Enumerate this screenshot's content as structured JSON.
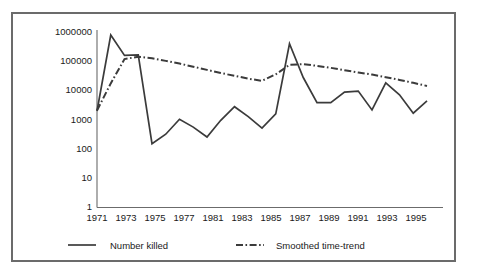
{
  "figure": {
    "frame_border_color": "#6b6b6b",
    "background_color": "#ffffff",
    "line_color": "#3b3b3b"
  },
  "legend": {
    "position": "bottom",
    "entries": [
      {
        "label": "Number killed",
        "style": "solid"
      },
      {
        "label": "Smoothed time-trend",
        "style": "dash-dot"
      }
    ]
  },
  "axes": {
    "y_tick_labels": [
      "1000000",
      "100000",
      "10000",
      "1000",
      "100",
      "10",
      "1"
    ],
    "x_tick_labels": [
      "1971",
      "1973",
      "1975",
      "1977",
      "1981",
      "1983",
      "1985",
      "1987",
      "1989",
      "1991",
      "1993",
      "1995"
    ]
  },
  "chart_data": {
    "type": "line",
    "title": "",
    "subtitle": "",
    "xlabel": "",
    "ylabel": "",
    "yscale": "log",
    "ylim": [
      1,
      1000000
    ],
    "xlim": [
      1971,
      1995
    ],
    "grid": false,
    "legend_position": "bottom",
    "y_ticks": [
      1,
      10,
      100,
      1000,
      10000,
      100000,
      1000000
    ],
    "y_tick_labels": [
      "1",
      "10",
      "100",
      "1000",
      "10000",
      "100000",
      "1000000"
    ],
    "x_ticks": [
      1971,
      1973,
      1975,
      1977,
      1981,
      1983,
      1985,
      1987,
      1989,
      1991,
      1993,
      1995
    ],
    "x_tick_labels": [
      "1971",
      "1973",
      "1975",
      "1977",
      "1981",
      "1983",
      "1985",
      "1987",
      "1989",
      "1991",
      "1993",
      "1995"
    ],
    "x": [
      1971,
      1972,
      1973,
      1974,
      1975,
      1976,
      1977,
      1978,
      1979,
      1980,
      1981,
      1982,
      1983,
      1984,
      1985,
      1986,
      1987,
      1988,
      1989,
      1990,
      1991,
      1992,
      1993,
      1994,
      1995
    ],
    "series": [
      {
        "name": "Number killed",
        "style": "solid",
        "values": [
          2500,
          1000000,
          200000,
          210000,
          190,
          400,
          1300,
          700,
          320,
          1200,
          3500,
          1600,
          650,
          2000,
          500000,
          35000,
          4800,
          4800,
          11000,
          12000,
          2700,
          23000,
          9000,
          2100,
          5500
        ]
      },
      {
        "name": "Smoothed time-trend",
        "style": "dash-dot",
        "values": [
          2600,
          22000,
          150000,
          180000,
          160000,
          130000,
          105000,
          82000,
          64000,
          50000,
          40000,
          32000,
          27000,
          45000,
          95000,
          100000,
          88000,
          75000,
          62000,
          52000,
          44000,
          36000,
          29000,
          23000,
          18000
        ]
      }
    ]
  }
}
